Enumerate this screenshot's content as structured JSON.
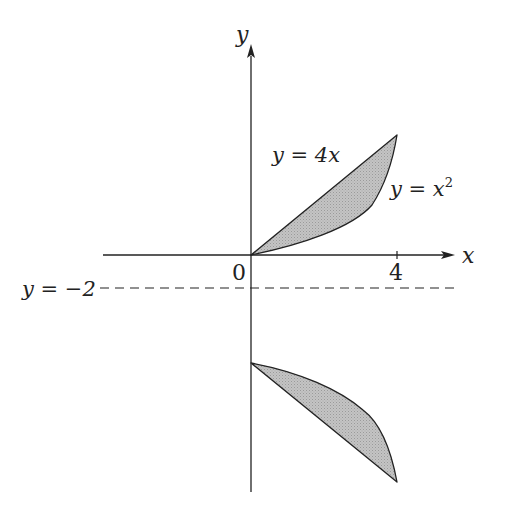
{
  "diagram": {
    "type": "region-between-curves",
    "axes": {
      "x_label": "x",
      "y_label": "y",
      "origin_label": "0",
      "x_tick_label": "4"
    },
    "curves": {
      "line_label": "y = 4x",
      "parabola_label_prefix": "y = x",
      "parabola_exponent": "2"
    },
    "axis_of_rotation": {
      "label": "y = −2",
      "style": "dashed"
    },
    "regions": [
      {
        "name": "upper-region",
        "bounded_by": [
          "y = 4x",
          "y = x^2"
        ],
        "x_range": [
          0,
          4
        ],
        "fill": "#bdbdbd"
      },
      {
        "name": "reflected-region",
        "description": "mirror image below y = -2",
        "fill": "#bdbdbd"
      }
    ],
    "colors": {
      "stroke": "#222222",
      "fill": "#bdbdbd",
      "background": "#ffffff"
    }
  }
}
